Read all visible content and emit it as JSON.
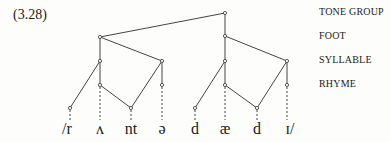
{
  "example_number": "(3.28)",
  "levels": [
    {
      "label": "TONE GROUP",
      "y": 13
    },
    {
      "label": "FOOT",
      "y": 37
    },
    {
      "label": "SYLLABLE",
      "y": 61
    },
    {
      "label": "RHYME",
      "y": 85
    }
  ],
  "segments": [
    {
      "text": "/r",
      "x": 68
    },
    {
      "text": "ʌ",
      "x": 100
    },
    {
      "text": "nt",
      "x": 131
    },
    {
      "text": "ə",
      "x": 162
    },
    {
      "text": "d",
      "x": 195
    },
    {
      "text": "æ",
      "x": 225
    },
    {
      "text": "d",
      "x": 257
    },
    {
      "text": "ɪ/",
      "x": 290
    }
  ],
  "colors": {
    "line": "#333333",
    "background": "#fdfdfb"
  }
}
